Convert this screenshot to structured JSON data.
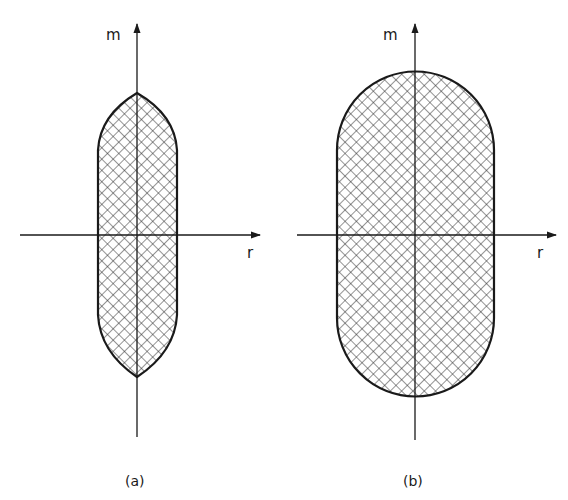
{
  "figure": {
    "panels": [
      {
        "id": "a",
        "caption": "(a)",
        "x_axis_label": "r",
        "y_axis_label": "m",
        "shape": "lens-capped rectangle (pointed ends)",
        "fill": "crosshatch"
      },
      {
        "id": "b",
        "caption": "(b)",
        "x_axis_label": "r",
        "y_axis_label": "m",
        "shape": "stadium (semicircular ends)",
        "fill": "crosshatch"
      }
    ],
    "colors": {
      "line": "#1a1a1a",
      "background": "#ffffff"
    }
  }
}
